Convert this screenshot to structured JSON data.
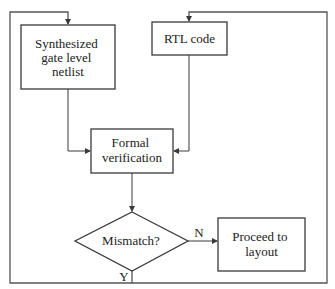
{
  "diagram": {
    "nodes": {
      "netlist": {
        "lines": [
          "Synthesized",
          "gate level",
          "netlist"
        ]
      },
      "rtl": {
        "lines": [
          "RTL code"
        ]
      },
      "formal": {
        "lines": [
          "Formal",
          "verification"
        ]
      },
      "mismatch": {
        "lines": [
          "Mismatch?"
        ]
      },
      "proceed": {
        "lines": [
          "Proceed to",
          "layout"
        ]
      }
    },
    "edges": {
      "no_label": "N",
      "yes_label": "Y"
    },
    "colors": {
      "stroke": "#3a3a3a",
      "background": "#ffffff",
      "text": "#222222"
    }
  }
}
